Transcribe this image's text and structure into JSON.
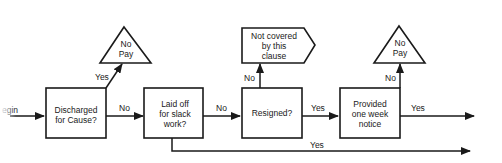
{
  "diagram": {
    "type": "flowchart",
    "start": {
      "label": "Begin",
      "visible_text": "egin"
    },
    "nodes": {
      "discharged": {
        "lines": [
          "Discharged",
          "for Cause?"
        ]
      },
      "laid_off": {
        "lines": [
          "Laid off",
          "for slack",
          "work?"
        ]
      },
      "resigned": {
        "lines": [
          "Resigned?"
        ]
      },
      "notice": {
        "lines": [
          "Provided",
          "one week",
          "notice"
        ]
      },
      "no_pay_1": {
        "lines": [
          "No",
          "Pay"
        ]
      },
      "not_covered": {
        "lines": [
          "Not covered",
          "by this",
          "clause"
        ]
      },
      "no_pay_2": {
        "lines": [
          "No",
          "Pay"
        ]
      }
    },
    "edges": {
      "discharged_yes": "Yes",
      "discharged_no": "No",
      "laid_off_no": "No",
      "laid_off_yes": "Yes",
      "resigned_no": "No",
      "resigned_yes": "Yes",
      "notice_no": "No",
      "notice_yes": "Yes"
    },
    "colors": {
      "ink": "#1a1a1a",
      "background": "#ffffff"
    }
  }
}
